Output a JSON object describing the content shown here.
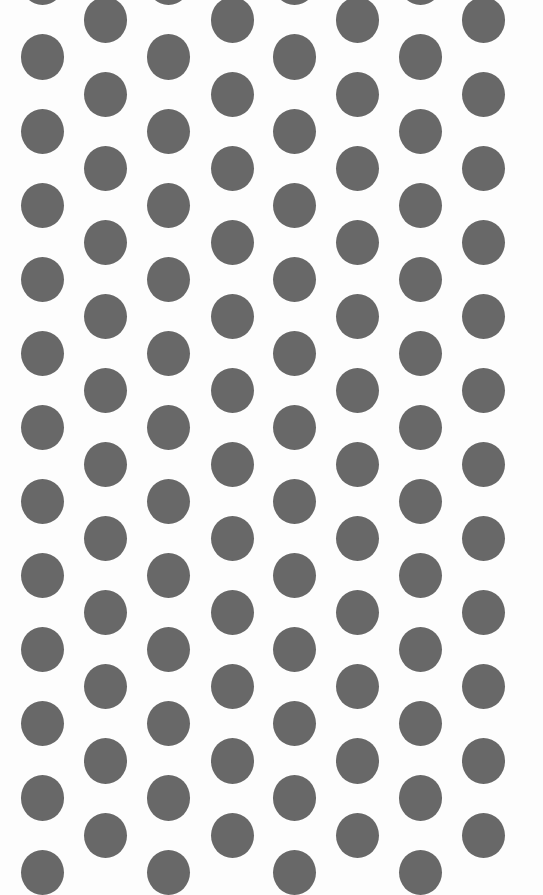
{
  "image": {
    "description": "White background with grey polka dot pattern",
    "background_color": "#fdfdfd",
    "dot_color": "#686868",
    "dot_radius": 21.5,
    "pattern": {
      "columns_a_x": [
        42,
        168,
        294,
        420
      ],
      "columns_b_x": [
        105,
        232,
        357,
        483
      ],
      "rows_a_y_start": 57,
      "rows_b_y_start": 20,
      "row_pitch": 74.1
    }
  }
}
